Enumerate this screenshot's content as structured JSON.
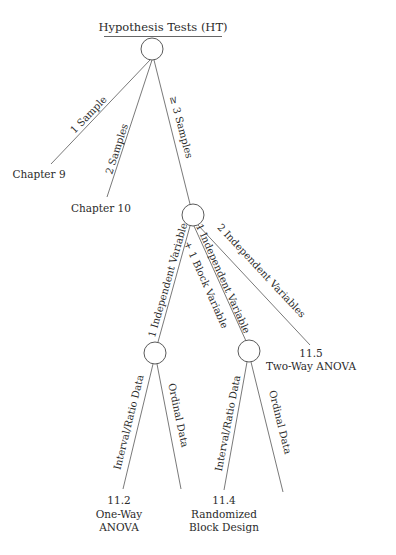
{
  "title": "Hypothesis Tests (HT)",
  "nodes": {
    "root": {
      "label": ""
    },
    "three_samples": {
      "label": ""
    },
    "one_iv": {
      "label": ""
    },
    "iv_block": {
      "label": ""
    }
  },
  "edges": {
    "one_sample": "1 Sample",
    "two_samples": "2 Samples",
    "three_samples": "≥ 3 Samples",
    "one_iv": "1 Independent Variable",
    "iv_block_line1": "1 Independent Variable",
    "iv_block_line2": "+ 1 Block Variable",
    "two_iv": "2 Independent Variables",
    "one_iv_interval": "Interval/Ratio Data",
    "one_iv_ordinal": "Ordinal Data",
    "block_interval": "Interval/Ratio Data",
    "block_ordinal": "Ordinal Data"
  },
  "leaves": {
    "chapter9": "Chapter 9",
    "chapter10": "Chapter 10",
    "two_way": {
      "section": "11.5",
      "name": "Two-Way ANOVA"
    },
    "one_way": {
      "section": "11.2",
      "line1": "One-Way",
      "line2": "ANOVA"
    },
    "randomized": {
      "section": "11.4",
      "line1": "Randomized",
      "line2": "Block Design"
    }
  },
  "colors": {
    "line": "#6a6a6a",
    "text": "#2b2b2b",
    "background": "#ffffff"
  }
}
